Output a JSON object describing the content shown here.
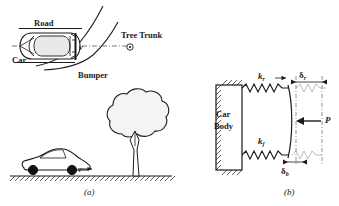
{
  "figure": {
    "panel_a": {
      "caption": "(a)",
      "labels": {
        "road": "Road",
        "car": "Car",
        "bumper": "Bumper",
        "tree_trunk": "Tree Trunk",
        "velocity_top": "v",
        "velocity_side": "v"
      }
    },
    "panel_b": {
      "caption": "(b)",
      "labels": {
        "car_body_line1": "Car",
        "car_body_line2": "Body",
        "stiffness_rear": "k",
        "stiffness_rear_sub": "r",
        "stiffness_front": "k",
        "stiffness_front_sub": "f",
        "deflection_rear": "δ",
        "deflection_rear_sub": "r",
        "deflection_bumper": "δ",
        "deflection_bumper_sub": "b",
        "force": "P"
      }
    },
    "colors": {
      "line": "#1a1a1a",
      "fill_light": "#efefef",
      "background": "#ffffff"
    }
  }
}
